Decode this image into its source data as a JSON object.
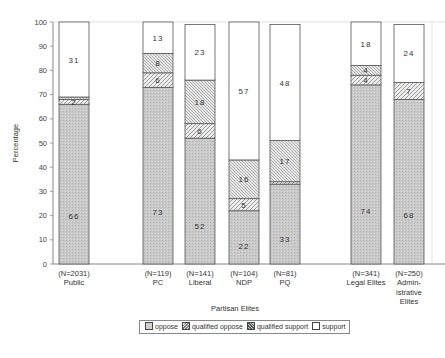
{
  "chart_data": {
    "type": "bar",
    "stacked": true,
    "title": "",
    "xlabel": "Partisan Elites",
    "ylabel": "Percentage",
    "ylim": [
      0,
      100
    ],
    "yticks": [
      0,
      10,
      20,
      30,
      40,
      50,
      60,
      70,
      80,
      90,
      100
    ],
    "categories": [
      {
        "n": "(N=2031)",
        "name": "Public"
      },
      {
        "n": "(N=119)",
        "name": "PC"
      },
      {
        "n": "(N=141)",
        "name": "Liberal"
      },
      {
        "n": "(N=104)",
        "name": "NDP"
      },
      {
        "n": "(N=81)",
        "name": "PQ"
      },
      {
        "n": "(N=341)",
        "name": "Legal Elites"
      },
      {
        "n": "(N=250)",
        "name": "Admin-istrative Elites"
      }
    ],
    "series": [
      {
        "name": "oppose",
        "values": [
          66,
          73,
          52,
          22,
          33,
          74,
          68
        ]
      },
      {
        "name": "qualified oppose",
        "values": [
          2,
          6,
          6,
          5,
          1,
          4,
          7
        ]
      },
      {
        "name": "qualified support",
        "values": [
          1,
          8,
          18,
          16,
          17,
          4,
          0
        ]
      },
      {
        "name": "support",
        "values": [
          31,
          13,
          23,
          57,
          48,
          18,
          24
        ]
      }
    ],
    "value_labels": [
      [
        "66",
        "2",
        "",
        "31"
      ],
      [
        "73",
        "6",
        "8",
        "13"
      ],
      [
        "52",
        "6",
        "18",
        "23"
      ],
      [
        "22",
        "5",
        "16",
        "57"
      ],
      [
        "33",
        "",
        "17",
        "48"
      ],
      [
        "74",
        "4",
        "4",
        "18"
      ],
      [
        "68",
        "7",
        "",
        "24"
      ]
    ],
    "legend_position": "bottom",
    "grid": false
  },
  "legend": {
    "items": [
      "oppose",
      "qualified oppose",
      "qualified support",
      "support"
    ]
  },
  "axis": {
    "ylabel": "Percentage",
    "xlabel": "Partisan Elites"
  }
}
